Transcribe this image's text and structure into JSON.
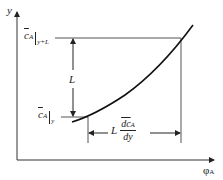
{
  "diagram": {
    "title": "",
    "axes": {
      "y_label": "y",
      "x_label": "φ",
      "x_label_sub": "A"
    },
    "labels": {
      "upper_level": {
        "symbol": "c",
        "sub": "A",
        "eval_sub": "y+L"
      },
      "lower_level": {
        "symbol": "c",
        "sub": "A",
        "eval_sub": "y"
      },
      "vertical_dimension": "L",
      "horizontal_dimension": {
        "prefix": "L",
        "numerator": "dc",
        "numerator_sub": "A",
        "denominator": "dy"
      }
    },
    "colors": {
      "line": "#222222",
      "axis": "#333333",
      "guide": "#555555",
      "background": "#ffffff"
    }
  }
}
